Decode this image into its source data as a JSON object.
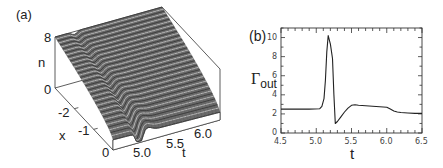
{
  "chart_data": [
    {
      "panel": "(a)",
      "type": "surface3d",
      "title": "",
      "xlabel": "t",
      "ylabel": "x",
      "zlabel": "n",
      "x_ticks": [
        "5.0",
        "5.5",
        "6.0"
      ],
      "y_ticks": [
        "0",
        "-1",
        "-2"
      ],
      "z_ticks": [
        "0",
        "8"
      ],
      "xlim": [
        4.9,
        6.4
      ],
      "ylim": [
        -3,
        0
      ],
      "zlim": [
        0,
        8
      ],
      "description": "Wireframe surface n(x,t): high (~8) at x=-3, decreasing toward x=0; a narrow trench/dip along t≈5.25 appearing near x=0 and propagating across x.",
      "surface_levels": {
        "x_minus3": 8,
        "x_0": 1.5
      }
    },
    {
      "panel": "(b)",
      "type": "line",
      "title": "",
      "xlabel": "t",
      "ylabel": "Γout",
      "xlim": [
        4.5,
        6.5
      ],
      "ylim": [
        0,
        11
      ],
      "x_ticks": [
        "4.5",
        "5.0",
        "5.5",
        "6.0",
        "6.5"
      ],
      "y_ticks": [
        "0",
        "2",
        "4",
        "6",
        "8",
        "10"
      ],
      "grid": false,
      "series": [
        {
          "name": "Γout",
          "x": [
            4.5,
            4.7,
            4.9,
            5.05,
            5.08,
            5.11,
            5.13,
            5.15,
            5.17,
            5.2,
            5.23,
            5.25,
            5.27,
            5.3,
            5.35,
            5.4,
            5.45,
            5.5,
            5.55,
            5.6,
            5.7,
            5.8,
            5.9,
            6.0,
            6.05,
            6.1,
            6.15,
            6.2,
            6.3,
            6.4,
            6.5
          ],
          "y": [
            2.5,
            2.5,
            2.5,
            2.55,
            2.8,
            3.6,
            5.5,
            8.5,
            10.2,
            9.3,
            7.8,
            4.0,
            1.0,
            1.2,
            1.7,
            2.2,
            2.6,
            2.9,
            2.95,
            2.9,
            2.85,
            2.8,
            2.75,
            2.7,
            2.5,
            2.3,
            2.2,
            2.15,
            2.1,
            2.05,
            2.05
          ]
        }
      ]
    }
  ],
  "panel_a": {
    "label": "(a)",
    "z_axis_label": "n",
    "z_tick_top": "8",
    "z_tick_bottom": "0",
    "x_axis_label": "x",
    "x_tick_m2": "-2",
    "x_tick_m1": "-1",
    "x_tick_0": "0",
    "t_axis_label": "t",
    "t_tick_50": "5.0",
    "t_tick_55": "5.5",
    "t_tick_60": "6.0"
  },
  "panel_b": {
    "label": "(b)",
    "y_axis_label_main": "Γ",
    "y_axis_label_sub": "out",
    "x_axis_label": "t",
    "y_ticks": [
      "0",
      "2",
      "4",
      "6",
      "8",
      "10"
    ],
    "x_ticks": [
      "4.5",
      "5.0",
      "5.5",
      "6.0",
      "6.5"
    ]
  }
}
